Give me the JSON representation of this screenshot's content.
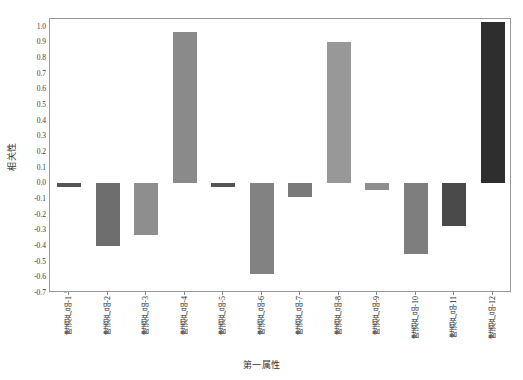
{
  "chart_data": {
    "type": "bar",
    "title": "",
    "xlabel": "第一属性",
    "ylabel": "相关性",
    "ylim": [
      -0.7,
      1.05
    ],
    "ytick_values": [
      1.0,
      0.9,
      0.8,
      0.7,
      0.6,
      0.5,
      0.4,
      0.3,
      0.2,
      0.1,
      0.0,
      -0.1,
      -0.2,
      -0.3,
      -0.4,
      -0.5,
      -0.6,
      -0.7
    ],
    "ytick_labels": [
      "1.0",
      "0.9",
      "0.8",
      "0.7",
      "0.6",
      "0.5",
      "0.4",
      "0.3",
      "0.2",
      "0.1",
      "0.0",
      "-0.1",
      "-0.2",
      "-0.3",
      "-0.4",
      "-0.5",
      "-0.6",
      "-0.7"
    ],
    "grid": false,
    "legend": "none",
    "categories": [
      "啤酒产品-1",
      "啤酒产品-2",
      "啤酒产品-3",
      "啤酒产品-4",
      "啤酒产品-5",
      "啤酒产品-6",
      "啤酒产品-7",
      "啤酒产品-8",
      "啤酒产品-9",
      "啤酒产品-10",
      "啤酒产品-11",
      "啤酒产品-12"
    ],
    "values": [
      -0.02,
      -0.4,
      -0.33,
      0.97,
      -0.02,
      -0.58,
      -0.09,
      0.9,
      -0.04,
      -0.45,
      -0.27,
      1.03
    ],
    "bar_colors": [
      "#555555",
      "#6e6e6e",
      "#8e8e8e",
      "#8a8a8a",
      "#555555",
      "#828282",
      "#7a7a7a",
      "#989898",
      "#8e8e8e",
      "#7e7e7e",
      "#4a4a4a",
      "#2e2e2e"
    ]
  },
  "axes": {
    "frame_color": "#999999",
    "tick_color": "#888888"
  }
}
